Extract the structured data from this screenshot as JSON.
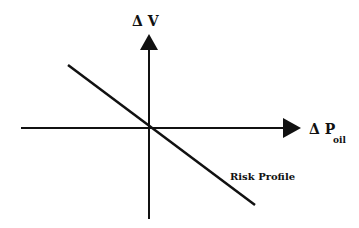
{
  "diagram": {
    "y_axis_label": "Δ V",
    "x_axis_label_main": "Δ P",
    "x_axis_label_sub": "oil",
    "line_label": "Risk Profile",
    "colors": {
      "ink": "#111111",
      "background": "#ffffff"
    }
  }
}
